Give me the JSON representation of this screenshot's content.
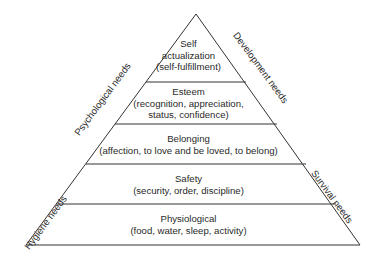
{
  "diagram": {
    "type": "pyramid",
    "levels": [
      {
        "title": "Self",
        "line2": "actualization",
        "line3": "(self-fulfillment)"
      },
      {
        "title": "Esteem",
        "line2": "(recognition, appreciation,",
        "line3": "status, confidence)"
      },
      {
        "title": "Belonging",
        "line2": "(affection, to love and be loved, to belong)"
      },
      {
        "title": "Safety",
        "line2": "(security, order, discipline)"
      },
      {
        "title": "Physiological",
        "line2": "(food, water, sleep, activity)"
      }
    ],
    "side_labels": {
      "left_upper": "Psychological needs",
      "left_lower": "Hygiene needs",
      "right_upper": "Development needs",
      "right_lower": "Survival needs"
    },
    "colors": {
      "line": "#333333",
      "background": "#ffffff"
    }
  }
}
